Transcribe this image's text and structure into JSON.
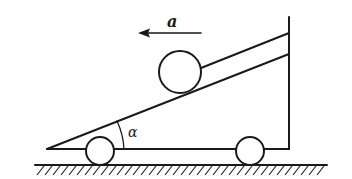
{
  "diagram": {
    "labels": {
      "acceleration": "a",
      "angle": "α"
    },
    "colors": {
      "stroke": "#1a1a1a",
      "background": "#ffffff"
    },
    "elements": [
      {
        "name": "cart-wedge",
        "type": "right-triangle with vertical post"
      },
      {
        "name": "ball",
        "type": "circle on incline"
      },
      {
        "name": "string",
        "type": "line from ball to post"
      },
      {
        "name": "wheel-left",
        "type": "circle"
      },
      {
        "name": "wheel-right",
        "type": "circle"
      },
      {
        "name": "ground",
        "type": "hatched surface"
      },
      {
        "name": "acceleration-arrow",
        "direction": "left"
      }
    ]
  }
}
